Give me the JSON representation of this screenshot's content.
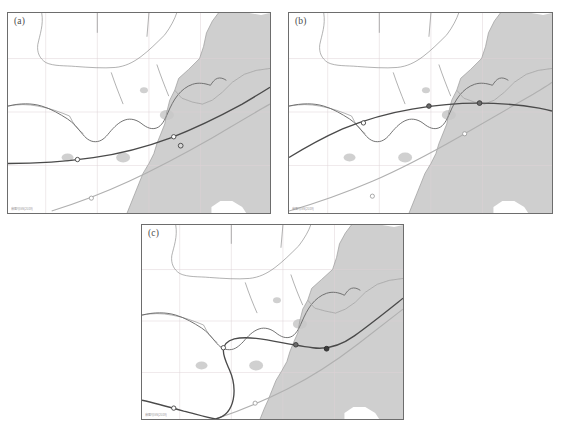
{
  "figure": {
    "type": "multi-panel-map-figure",
    "panel_count": 3,
    "background_color": "#ffffff"
  },
  "colors": {
    "sea_fill": "#cfcfcf",
    "land_fill": "#ffffff",
    "coastline": "#9a9a9a",
    "province_boundary": "#8f8f8f",
    "province_boundary_dark": "#6a6a6a",
    "graticule": "#ded3d6",
    "river_lake": "#c8c8c8",
    "track_primary": "#4a4a4a",
    "track_secondary": "#b0b0b0",
    "marker_fill": "#ffffff",
    "marker_stroke": "#4a4a4a",
    "panel_border": "#6d6d6d",
    "label_text": "#4a4a4a",
    "watermark_text": "#8d8d8d"
  },
  "panels": [
    {
      "id": "a",
      "label": "(a)",
      "watermark": "审图号GS(2019)",
      "tracks": [
        {
          "name": "track-primary",
          "style": "solid-dark",
          "marker_count": 3,
          "description": "near-zonal track entering from west, curving northeast across the coast"
        },
        {
          "name": "track-secondary",
          "style": "solid-light",
          "marker_count": 1,
          "description": "light gray track from lower-left rising to upper-right offshore"
        }
      ]
    },
    {
      "id": "b",
      "label": "(b)",
      "watermark": "审图号GS(2019)",
      "tracks": [
        {
          "name": "track-primary",
          "style": "solid-dark",
          "marker_count": 3,
          "description": "arcing track rising from southwest, peaking over land, exiting east"
        },
        {
          "name": "track-secondary",
          "style": "solid-light",
          "marker_count": 2,
          "description": "light gray track sweeping from lower-left to upper-right"
        }
      ]
    },
    {
      "id": "c",
      "label": "(c)",
      "watermark": "审图号GS(2019)",
      "tracks": [
        {
          "name": "track-primary",
          "style": "solid-dark",
          "marker_count": 4,
          "description": "looping track that dips south, hooks back north and exits northeast over the coast"
        },
        {
          "name": "track-secondary",
          "style": "solid-light",
          "marker_count": 1,
          "description": "light gray track crossing from lower-left to upper-right"
        }
      ]
    }
  ]
}
